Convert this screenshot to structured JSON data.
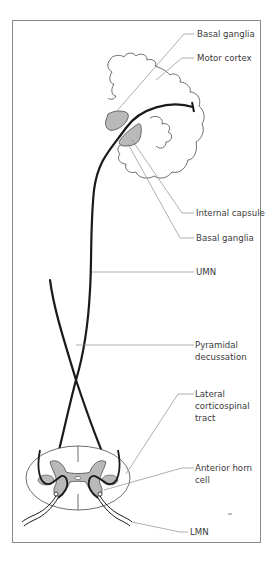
{
  "figure": {
    "labels": {
      "basal_ganglia_top": "Basal ganglia",
      "motor_cortex": "Motor cortex",
      "internal_capsule": "Internal capsule",
      "basal_ganglia_bottom": "Basal ganglia",
      "umn": "UMN",
      "pyramidal_decussation_line1": "Pyramidal",
      "pyramidal_decussation_line2": "decussation",
      "lateral_corticospinal_line1": "Lateral",
      "lateral_corticospinal_line2": "corticospinal",
      "lateral_corticospinal_line3": "tract",
      "anterior_horn_line1": "Anterior horn",
      "anterior_horn_line2": "cell",
      "lmn": "LMN"
    },
    "caption_partial": "",
    "colors": {
      "frame": "#8a8a8a",
      "pathway": "#1a1a1a",
      "gray_matter": "#b9b9b9",
      "leader_line": "#8c8c8c",
      "outline": "#4a4a4a"
    }
  }
}
